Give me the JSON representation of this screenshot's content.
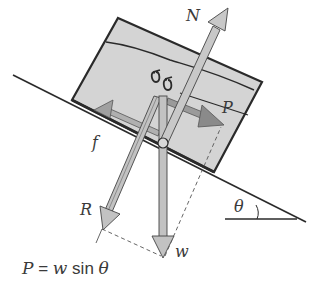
{
  "diagram": {
    "labels": {
      "normal_force": "N",
      "applied_force": "P",
      "friction": "f",
      "resultant": "R",
      "weight": "w",
      "angle": "θ"
    },
    "formula": {
      "lhs": "P",
      "equals": " = ",
      "w": "w",
      "func": " sin ",
      "angle": "θ"
    },
    "colors": {
      "block_fill": "#d4d4d4",
      "arrow_fill": "#bdbdbd",
      "arrow_dark": "#8a8a8a",
      "outline": "#2a2a2a",
      "text": "#3a3a3a"
    }
  }
}
